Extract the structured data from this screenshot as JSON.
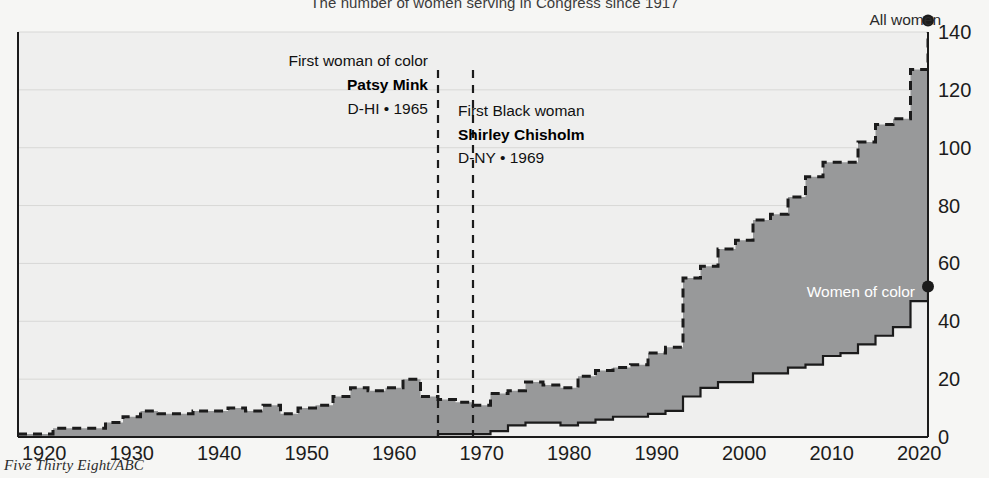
{
  "title": "The number of women serving in Congress since 1917",
  "credit": "Five Thirty Eight/ABC",
  "labels": {
    "all_women": "All women",
    "women_of_color": "Women of color"
  },
  "annotations": [
    {
      "id": "patsy-mink",
      "line1": "First woman of color",
      "name": "Patsy Mink",
      "meta": "D-HI • 1965",
      "year": 1965
    },
    {
      "id": "shirley-chisholm",
      "line1": "First Black woman",
      "name": "Shirley Chisholm",
      "meta": "D-NY • 1969",
      "year": 1969
    }
  ],
  "colors": {
    "fill": "#98999a",
    "outline_dark": "#1b1b1b",
    "page_bg": "#f6f6f4",
    "plot_bg": "#efefee",
    "gridline": "#d8d8d6",
    "text": "#1c1c1c",
    "label_light": "#ffffff"
  },
  "chart_data": {
    "type": "area",
    "title": "The number of women serving in Congress since 1917",
    "xlabel": "",
    "ylabel": "",
    "xlim": [
      1917,
      2021
    ],
    "ylim": [
      0,
      140
    ],
    "yticks": [
      0,
      20,
      40,
      60,
      80,
      100,
      120,
      140
    ],
    "xticks": [
      1920,
      1930,
      1940,
      1950,
      1960,
      1970,
      1980,
      1990,
      2000,
      2010,
      2020
    ],
    "grid": "horizontal",
    "legend": "inline-labels",
    "x": [
      1917,
      1918,
      1919,
      1920,
      1921,
      1922,
      1923,
      1924,
      1925,
      1926,
      1927,
      1928,
      1929,
      1930,
      1931,
      1932,
      1933,
      1934,
      1935,
      1936,
      1937,
      1938,
      1939,
      1940,
      1941,
      1942,
      1943,
      1944,
      1945,
      1946,
      1947,
      1948,
      1949,
      1950,
      1951,
      1952,
      1953,
      1954,
      1955,
      1956,
      1957,
      1958,
      1959,
      1960,
      1961,
      1962,
      1963,
      1964,
      1965,
      1966,
      1967,
      1968,
      1969,
      1970,
      1971,
      1972,
      1973,
      1974,
      1975,
      1976,
      1977,
      1978,
      1979,
      1980,
      1981,
      1982,
      1983,
      1984,
      1985,
      1986,
      1987,
      1988,
      1989,
      1990,
      1991,
      1992,
      1993,
      1994,
      1995,
      1996,
      1997,
      1998,
      1999,
      2000,
      2001,
      2002,
      2003,
      2004,
      2005,
      2006,
      2007,
      2008,
      2009,
      2010,
      2011,
      2012,
      2013,
      2014,
      2015,
      2016,
      2017,
      2018,
      2019,
      2020,
      2021
    ],
    "series": [
      {
        "name": "All women",
        "style": "dashed-outline-area",
        "values": [
          1,
          1,
          1,
          1,
          3,
          3,
          3,
          3,
          3,
          3,
          5,
          5,
          7,
          7,
          9,
          9,
          8,
          8,
          8,
          8,
          9,
          9,
          9,
          9,
          10,
          10,
          9,
          9,
          11,
          11,
          8,
          8,
          10,
          10,
          11,
          11,
          14,
          14,
          17,
          17,
          16,
          16,
          17,
          17,
          20,
          20,
          14,
          14,
          13,
          13,
          12,
          12,
          11,
          11,
          15,
          15,
          16,
          16,
          19,
          19,
          18,
          18,
          17,
          17,
          21,
          21,
          23,
          23,
          24,
          24,
          25,
          25,
          29,
          29,
          31,
          31,
          55,
          55,
          59,
          59,
          65,
          65,
          68,
          68,
          75,
          75,
          77,
          77,
          83,
          83,
          90,
          90,
          95,
          95,
          95,
          95,
          102,
          102,
          108,
          108,
          110,
          110,
          127,
          127,
          144
        ],
        "end_value": 144,
        "end_marker": true
      },
      {
        "name": "Women of color",
        "style": "solid-outline-area",
        "values": [
          0,
          0,
          0,
          0,
          0,
          0,
          0,
          0,
          0,
          0,
          0,
          0,
          0,
          0,
          0,
          0,
          0,
          0,
          0,
          0,
          0,
          0,
          0,
          0,
          0,
          0,
          0,
          0,
          0,
          0,
          0,
          0,
          0,
          0,
          0,
          0,
          0,
          0,
          0,
          0,
          0,
          0,
          0,
          0,
          0,
          0,
          0,
          0,
          1,
          1,
          1,
          1,
          1,
          1,
          2,
          2,
          4,
          4,
          5,
          5,
          5,
          5,
          4,
          4,
          5,
          5,
          6,
          6,
          7,
          7,
          7,
          7,
          8,
          8,
          9,
          9,
          14,
          14,
          17,
          17,
          19,
          19,
          19,
          19,
          22,
          22,
          22,
          22,
          24,
          24,
          25,
          25,
          28,
          28,
          29,
          29,
          32,
          32,
          35,
          35,
          38,
          38,
          47,
          47,
          52
        ],
        "end_value": 52,
        "end_marker": true
      }
    ]
  }
}
